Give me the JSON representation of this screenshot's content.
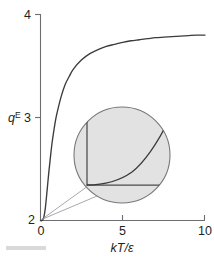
{
  "chart_data": {
    "type": "line",
    "title": "",
    "subtitle": "",
    "xlabel": "kT/ε",
    "ylabel": "q",
    "ylabel_superscript": "E",
    "xlim": [
      0,
      10
    ],
    "ylim": [
      2,
      4
    ],
    "grid": false,
    "legend": null,
    "xticks": [
      0,
      5,
      10
    ],
    "xtick_labels": [
      "0",
      "5",
      "10"
    ],
    "yticks": [
      2,
      3,
      4
    ],
    "ytick_labels": [
      "2",
      "3",
      "4"
    ],
    "series": [
      {
        "name": "q^E",
        "x": [
          0,
          0.1,
          0.2,
          0.3,
          0.4,
          0.5,
          0.6,
          0.7,
          0.8,
          0.9,
          1.0,
          1.25,
          1.5,
          1.75,
          2.0,
          2.5,
          3.0,
          3.5,
          4.0,
          4.5,
          5.0,
          5.5,
          6.0,
          6.5,
          7.0,
          7.5,
          8.0,
          8.5,
          9.0,
          9.5,
          10.0
        ],
        "y": [
          2.0,
          2.0,
          2.03,
          2.13,
          2.29,
          2.46,
          2.61,
          2.75,
          2.86,
          2.96,
          3.04,
          3.2,
          3.32,
          3.4,
          3.47,
          3.56,
          3.62,
          3.66,
          3.69,
          3.71,
          3.73,
          3.745,
          3.755,
          3.765,
          3.775,
          3.78,
          3.785,
          3.79,
          3.795,
          3.8,
          3.8
        ]
      }
    ],
    "annotations": [
      {
        "type": "magnifier-inset",
        "name": "origin-magnifier",
        "description": "Circular magnified detail of the curve near the origin showing it leaving the axis corner",
        "center_x": 5.0,
        "center_y": 2.62,
        "source_point": [
          0,
          2
        ]
      }
    ]
  },
  "figure": {
    "axis_color": "#6d6e71",
    "curve_color": "#3b3b3d",
    "inset_fill": "#e2e2e2",
    "inset_stroke": "#77787b",
    "leader_color": "#8b8c8e",
    "background": "#ffffff"
  },
  "labels": {
    "y_top": "4",
    "y_mid": "3",
    "y_bottom": "2",
    "x_left": "0",
    "x_mid": "5",
    "x_right": "10",
    "x_axis_title": "kT/ε",
    "y_axis_title": "q",
    "y_axis_title_sup": "E"
  }
}
